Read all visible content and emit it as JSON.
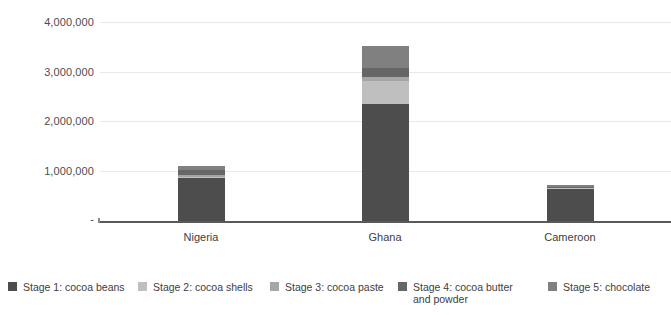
{
  "chart_data": {
    "type": "bar",
    "subtype": "stacked-vertical",
    "title": "",
    "xlabel": "",
    "ylabel": "",
    "categories": [
      "Nigeria",
      "Ghana",
      "Cameroon"
    ],
    "ylim": [
      0,
      4000000
    ],
    "ytick_values": [
      0,
      1000000,
      2000000,
      3000000,
      4000000
    ],
    "ytick_labels": [
      "-",
      "1,000,000",
      "2,000,000",
      "3,000,000",
      "4,000,000"
    ],
    "grid": true,
    "legend_position": "bottom",
    "series": [
      {
        "name": "Stage 1: cocoa beans",
        "color": "#4d4d4d",
        "values": [
          870000,
          2360000,
          640000
        ]
      },
      {
        "name": "Stage 2: cocoa shells",
        "color": "#bfbfbf",
        "values": [
          20000,
          460000,
          15000
        ]
      },
      {
        "name": "Stage 3: cocoa paste",
        "color": "#a6a6a6",
        "values": [
          40000,
          80000,
          10000
        ]
      },
      {
        "name": "Stage 4: cocoa butter and powder",
        "color": "#666666",
        "values": [
          90000,
          180000,
          20000
        ]
      },
      {
        "name": "Stage 5: chocolate",
        "color": "#808080",
        "values": [
          80000,
          440000,
          35000
        ]
      }
    ],
    "totals": [
      1100000,
      3520000,
      720000
    ]
  },
  "legend": {
    "items": [
      {
        "label": "Stage 1: cocoa beans",
        "color": "#4d4d4d"
      },
      {
        "label": "Stage 2: cocoa shells",
        "color": "#bfbfbf"
      },
      {
        "label": "Stage 3: cocoa paste",
        "color": "#a6a6a6"
      },
      {
        "label": "Stage 4: cocoa butter\nand powder",
        "color": "#666666"
      },
      {
        "label": "Stage 5: chocolate",
        "color": "#808080"
      }
    ]
  },
  "axis": {
    "ytick_labels": [
      "4,000,000",
      "3,000,000",
      "2,000,000",
      "1,000,000",
      "-"
    ],
    "categories": [
      "Nigeria",
      "Ghana",
      "Cameroon"
    ]
  },
  "colors": {
    "gridline": "#e8e8e8",
    "axis": "#595959",
    "text": "#404040",
    "background": "#ffffff"
  }
}
